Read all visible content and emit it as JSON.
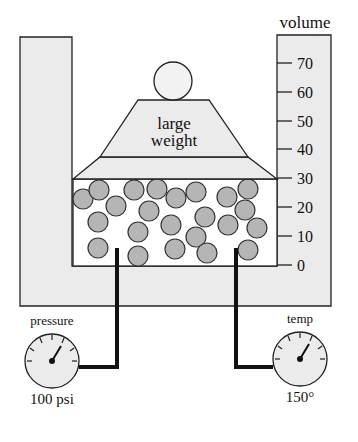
{
  "diagram": {
    "volume_scale": {
      "label": "volume",
      "ticks": [
        {
          "value": "70",
          "y": 63
        },
        {
          "value": "60",
          "y": 92
        },
        {
          "value": "50",
          "y": 121
        },
        {
          "value": "40",
          "y": 149
        },
        {
          "value": "30",
          "y": 178
        },
        {
          "value": "20",
          "y": 207
        },
        {
          "value": "10",
          "y": 236
        },
        {
          "value": "0",
          "y": 265
        }
      ]
    },
    "weight": {
      "label_line1": "large",
      "label_line2": "weight"
    },
    "pressure_gauge": {
      "label": "pressure",
      "reading": "100 psi"
    },
    "temp_gauge": {
      "label": "temp",
      "reading": "150°"
    },
    "colors": {
      "wall_fill": "#ebebeb",
      "molecule_fill": "#b5b5b5",
      "stroke": "#222222",
      "pipe": "#111111"
    },
    "molecules": [
      [
        83,
        199
      ],
      [
        99,
        190
      ],
      [
        116,
        206
      ],
      [
        134,
        190
      ],
      [
        157,
        189
      ],
      [
        149,
        211
      ],
      [
        176,
        198
      ],
      [
        196,
        192
      ],
      [
        227,
        197
      ],
      [
        248,
        189
      ],
      [
        98,
        222
      ],
      [
        138,
        232
      ],
      [
        171,
        225
      ],
      [
        205,
        217
      ],
      [
        228,
        225
      ],
      [
        245,
        210
      ],
      [
        257,
        228
      ],
      [
        98,
        248
      ],
      [
        138,
        256
      ],
      [
        175,
        249
      ],
      [
        196,
        237
      ],
      [
        207,
        253
      ],
      [
        248,
        250
      ]
    ]
  }
}
